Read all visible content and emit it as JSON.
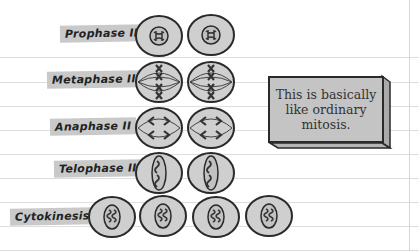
{
  "phases": [
    {
      "label": "Prophase II",
      "cells": 2
    },
    {
      "label": "Metaphase II",
      "cells": 2
    },
    {
      "label": "Anaphase II",
      "cells": 2
    },
    {
      "label": "Telophase II",
      "cells": 2
    },
    {
      "label": "Cytokinesis",
      "cells": 4
    }
  ],
  "note": {
    "line1": "This is basically",
    "line2": "like ordinary",
    "line3": "mitosis."
  },
  "colors": {
    "cell_fill": "#cfcfcf",
    "outline": "#2a2a2a",
    "label_bg": "#c9c9c9",
    "note_bg": "#c4c4c4"
  }
}
